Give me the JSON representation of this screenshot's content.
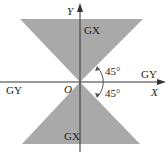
{
  "diagram": {
    "colors": {
      "shade": "#a9a9a9",
      "axis": "#333333",
      "text": "#222222",
      "background": "#ffffff"
    },
    "axes": {
      "x_label": "X",
      "y_label": "Y",
      "origin_label": "O"
    },
    "regions": {
      "top_label": "GX",
      "bottom_label": "GX",
      "left_label": "GY",
      "right_label": "GY"
    },
    "angles": {
      "upper": "45°",
      "lower": "45°"
    }
  }
}
